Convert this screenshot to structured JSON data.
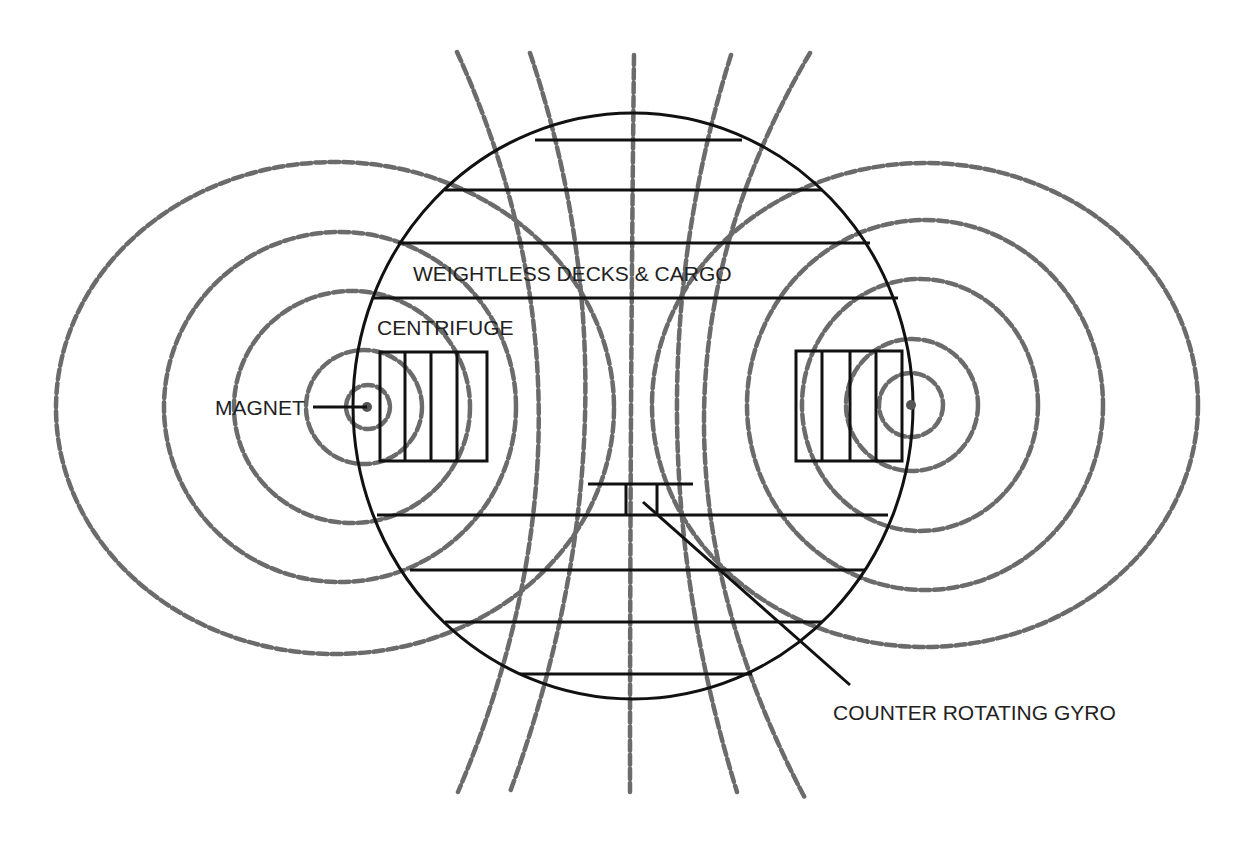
{
  "diagram": {
    "labels": {
      "decks": "WEIGHTLESS DECKS & CARGO",
      "centrifuge": "CENTRIFUGE",
      "magnet": "MAGNET",
      "gyro": "COUNTER ROTATING GYRO"
    },
    "components": [
      {
        "name": "hull",
        "shape": "ellipse"
      },
      {
        "name": "left-magnet",
        "shape": "dot"
      },
      {
        "name": "right-magnet",
        "shape": "dot"
      },
      {
        "name": "left-centrifuge",
        "shape": "rectangle",
        "sections": 4
      },
      {
        "name": "right-centrifuge",
        "shape": "rectangle",
        "sections": 4
      },
      {
        "name": "counter-rotating-gyro",
        "shape": "T-bar"
      },
      {
        "name": "decks",
        "count": 8
      }
    ],
    "field_lines": {
      "style": "dashed",
      "concentric_rings_per_magnet": 5,
      "vertical_field_lines": 5
    },
    "colors": {
      "structure": "#111111",
      "field": "#6b6b6b",
      "text": "#222222",
      "background": "#ffffff"
    }
  }
}
